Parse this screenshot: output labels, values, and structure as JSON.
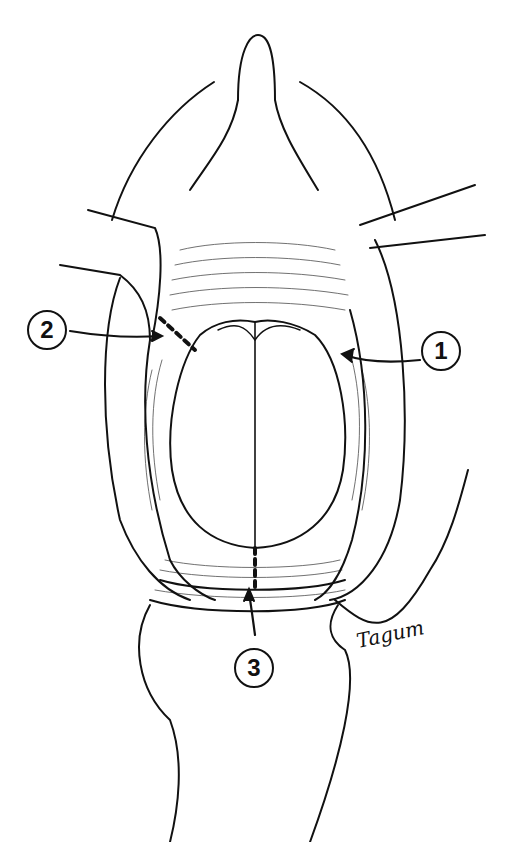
{
  "figure": {
    "type": "surgical line-art illustration",
    "callouts": [
      {
        "label": "1",
        "x": 441,
        "y": 351
      },
      {
        "label": "2",
        "x": 47,
        "y": 330
      },
      {
        "label": "3",
        "x": 254,
        "y": 668
      }
    ],
    "signature": "Tagum"
  }
}
